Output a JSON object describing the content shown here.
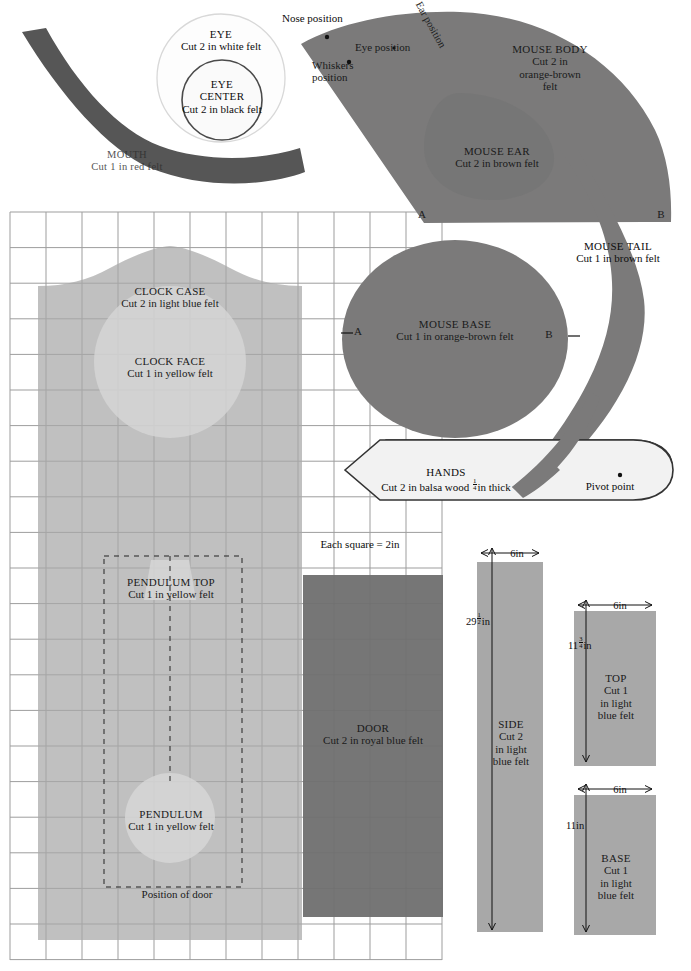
{
  "sheet": {
    "scale_note": "Each square = 2in",
    "grid": {
      "cell_px": 36,
      "x": 10,
      "y": 212,
      "cols": 12,
      "rows": 21
    }
  },
  "colors": {
    "felt_brown": "#7b7a7a",
    "felt_dark_red": "#555555",
    "light_blue": "#a9a9a9",
    "yellow": "#cdcdcd",
    "royal_blue": "#6f6f6f",
    "balsa": "#ededed",
    "grid_line": "#9a9a9a",
    "outline": "#3a3a3a",
    "white_felt": "#fbfbfb"
  },
  "pieces": {
    "mouth": {
      "name": "MOUTH",
      "cut": "Cut 1 in red felt"
    },
    "eye": {
      "name": "EYE",
      "cut": "Cut 2 in white felt"
    },
    "eye_center": {
      "name": "EYE",
      "name2": "CENTER",
      "cut": "Cut 2 in black felt"
    },
    "mouse_body": {
      "name": "MOUSE BODY",
      "cut_l1": "Cut 2 in",
      "cut_l2": "orange-brown",
      "cut_l3": "felt"
    },
    "mouse_ear": {
      "name": "MOUSE EAR",
      "cut": "Cut 2 in brown felt"
    },
    "mouse_tail": {
      "name": "MOUSE TAIL",
      "cut": "Cut 1 in brown felt"
    },
    "mouse_base": {
      "name": "MOUSE BASE",
      "cut": "Cut 1 in orange-brown felt"
    },
    "hands": {
      "name": "HANDS",
      "cut_pre": "Cut 2 in balsa wood ",
      "cut_frac_num": "1",
      "cut_frac_den": "4",
      "cut_post": "in thick"
    },
    "clock_case": {
      "name": "CLOCK CASE",
      "cut": "Cut 2 in light blue felt"
    },
    "clock_face": {
      "name": "CLOCK FACE",
      "cut": "Cut 1 in yellow felt"
    },
    "pendulum_top": {
      "name": "PENDULUM TOP",
      "cut": "Cut 1 in yellow felt"
    },
    "pendulum": {
      "name": "PENDULUM",
      "cut": "Cut 1 in yellow felt"
    },
    "door": {
      "name": "DOOR",
      "cut": "Cut 2 in royal blue felt"
    },
    "side": {
      "name": "SIDE",
      "cut_l1": "Cut 2",
      "cut_l2": "in light",
      "cut_l3": "blue felt",
      "width": "6in",
      "height_whole": "29",
      "height_frac_num": "1",
      "height_frac_den": "2",
      "height_unit": "in"
    },
    "top": {
      "name": "TOP",
      "cut_l1": "Cut 1",
      "cut_l2": "in light",
      "cut_l3": "blue felt",
      "width": "6in",
      "height_whole": "11",
      "height_frac_num": "3",
      "height_frac_den": "4",
      "height_unit": "in"
    },
    "base": {
      "name": "BASE",
      "cut_l1": "Cut 1",
      "cut_l2": "in light",
      "cut_l3": "blue felt",
      "width": "6in",
      "height": "11in"
    }
  },
  "markers": {
    "nose_position": "Nose position",
    "eye_position": "Eye position",
    "ear_position": "Ear position",
    "whiskers_position_l1": "Whiskers",
    "whiskers_position_l2": "position",
    "pivot_point": "Pivot point",
    "position_of_door": "Position of door",
    "a_left_body": "A",
    "b_right_body": "B",
    "a_left_base": "A",
    "b_right_base": "B"
  }
}
